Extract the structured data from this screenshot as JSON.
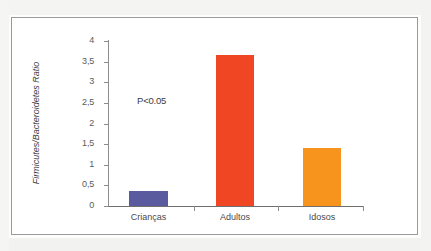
{
  "figure": {
    "frame_color": "#9a9a9a",
    "background": "#ffffff"
  },
  "annotation": {
    "p_value": "P<0.05"
  },
  "chart_data": {
    "type": "bar",
    "title": "",
    "xlabel": "",
    "ylabel": "Firmicutes/Bacteroidetes Ratio",
    "categories": [
      "Crianças",
      "Adultos",
      "Idosos"
    ],
    "values": [
      0.36,
      3.66,
      1.4
    ],
    "colors": [
      "#5a5a9e",
      "#f04623",
      "#f7941e"
    ],
    "ylim": [
      0,
      4
    ],
    "ytick_values": [
      0,
      0.5,
      1,
      1.5,
      2,
      2.5,
      3,
      3.5,
      4
    ],
    "ytick_labels": [
      "0",
      "0,5",
      "1",
      "1,5",
      "2",
      "2,5",
      "3",
      "3,5",
      "4"
    ],
    "grid": false,
    "legend": false,
    "annotations": [
      "P<0.05"
    ]
  }
}
